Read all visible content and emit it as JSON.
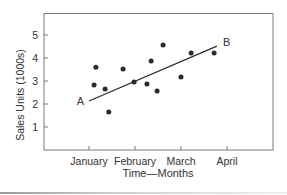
{
  "chart_data": {
    "type": "scatter",
    "title": "",
    "xlabel": "Time—Months",
    "ylabel": "Sales Units (1000s)",
    "x_tick_labels": [
      "January",
      "February",
      "March",
      "April"
    ],
    "x_tick_values": [
      0,
      1,
      2,
      3
    ],
    "y_tick_labels": [
      "1",
      "2",
      "3",
      "4",
      "5"
    ],
    "y_tick_values": [
      1,
      2,
      3,
      4,
      5
    ],
    "xlim": [
      -1.0,
      4.0
    ],
    "ylim": [
      0,
      5.9
    ],
    "grid": false,
    "legend": null,
    "series": [
      {
        "name": "Observed sales",
        "type": "scatter",
        "x": [
          0.11,
          0.15,
          0.35,
          0.43,
          0.74,
          0.98,
          1.26,
          1.35,
          1.48,
          1.61,
          2.0,
          2.22,
          2.72
        ],
        "y": [
          2.83,
          3.6,
          2.65,
          1.65,
          3.52,
          2.96,
          2.87,
          3.87,
          2.57,
          4.57,
          3.17,
          4.22,
          4.22
        ]
      },
      {
        "name": "Trend line",
        "type": "line",
        "x": [
          0.0,
          2.78
        ],
        "y": [
          2.13,
          4.52
        ]
      }
    ],
    "annotations": [
      {
        "text": "A",
        "x": 0.0,
        "y": 2.13,
        "position": "left"
      },
      {
        "text": "B",
        "x": 2.78,
        "y": 4.52,
        "position": "right"
      }
    ]
  },
  "colors": {
    "axis": "#7a7a7a",
    "point": "#2b2b2b",
    "line": "#2b2b2b",
    "text": "#333333"
  }
}
